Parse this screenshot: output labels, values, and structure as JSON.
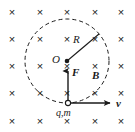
{
  "figure": {
    "width": 135,
    "height": 132,
    "background_color": "#ffffff",
    "stroke_color": "#1a1a1a"
  },
  "labels": {
    "center_point": "O",
    "radius": "R",
    "force": "F",
    "magnetic_field": "B",
    "velocity": "v",
    "particle": "q,m"
  },
  "field": {
    "symbol": "×",
    "meaning": "magnetic-field-into-page",
    "symbol_color": "#1a1a1a",
    "symbol_size": 11,
    "columns_x": [
      12,
      40,
      67,
      95,
      121
    ],
    "rows_y": [
      12,
      39,
      66,
      93,
      121
    ]
  },
  "circle": {
    "center_x": 67,
    "center_y": 61,
    "radius": 42,
    "style": "dashed",
    "dash_pattern": "4 3",
    "stroke_width": 1
  },
  "radius_line": {
    "from_x": 67,
    "from_y": 61,
    "to_x": 99,
    "to_y": 34
  },
  "center_dot": {
    "x": 67,
    "y": 61,
    "radius": 2.3,
    "fill": "#1a1a1a"
  },
  "particle": {
    "x": 68,
    "y": 103,
    "radius": 2.6,
    "fill": "#ffffff",
    "stroke": "#1a1a1a"
  },
  "force_arrow": {
    "from_x": 68,
    "from_y": 103,
    "to_x": 68,
    "to_y": 69,
    "direction": "up",
    "description": "centripetal-force-toward-center"
  },
  "velocity_arrow": {
    "from_x": 68,
    "from_y": 103,
    "to_x": 113,
    "to_y": 103,
    "direction": "right",
    "description": "tangential-velocity"
  }
}
